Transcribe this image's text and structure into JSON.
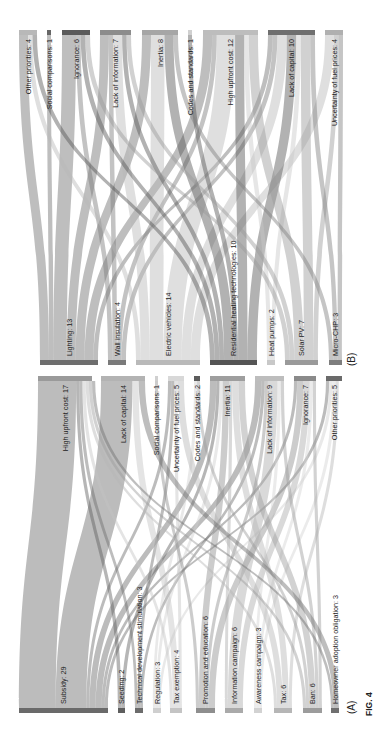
{
  "figure": {
    "caption": "FIG. 4",
    "orientation": "rotated -90deg (labels read bottom-to-top)"
  },
  "chart_data": [
    {
      "type": "sankey",
      "panel_label": "(B)",
      "title": "",
      "source_side": "bottom",
      "sources": [
        {
          "name": "Lighting",
          "value": 13,
          "label": "Lighting: 13",
          "x0": 40,
          "x1": 98,
          "color": "#6e6e6e"
        },
        {
          "name": "Wall insulation",
          "value": 4,
          "label": "Wall insulation: 4",
          "x0": 108,
          "x1": 126,
          "color": "#7a7a7a"
        },
        {
          "name": "Electric vehicles",
          "value": 14,
          "label": "Electric vehicles: 14",
          "x0": 136,
          "x1": 200,
          "color": "#b9b9b9"
        },
        {
          "name": "Residential heating technologies",
          "value": 10,
          "label": "Residential heating technologies: 10",
          "x0": 210,
          "x1": 257,
          "color": "#555555"
        },
        {
          "name": "Heat pumps",
          "value": 2,
          "label": "Heat pumps: 2",
          "x0": 267,
          "x1": 275,
          "color": "#c8c8c8"
        },
        {
          "name": "Solar PV",
          "value": 7,
          "label": "Solar PV: 7",
          "x0": 285,
          "x1": 318,
          "color": "#9a9a9a"
        },
        {
          "name": "Micro-CHP",
          "value": 3,
          "label": "Micro-CHP: 3",
          "x0": 329,
          "x1": 342,
          "color": "#7e7e7e"
        }
      ],
      "targets": [
        {
          "name": "Other priorities",
          "value": 4,
          "label": "Other priorities: 4",
          "x0": 19,
          "x1": 37,
          "color": "#b8b8b8"
        },
        {
          "name": "Social comparisons",
          "value": 1,
          "label": "Social comparisons: 1",
          "x0": 47,
          "x1": 51,
          "color": "#666666"
        },
        {
          "name": "Ignorance",
          "value": 6,
          "label": "Ignorance: 6",
          "x0": 62,
          "x1": 90,
          "color": "#5a5a5a"
        },
        {
          "name": "Lack of information",
          "value": 7,
          "label": "Lack of information: 7",
          "x0": 100,
          "x1": 131,
          "color": "#8c8c8c"
        },
        {
          "name": "Inertia",
          "value": 8,
          "label": "Inertia: 8",
          "x0": 142,
          "x1": 178,
          "color": "#a6a6a6"
        },
        {
          "name": "Codes and standards",
          "value": 1,
          "label": "Codes and standards: 1",
          "x0": 188,
          "x1": 192,
          "color": "#d0d0d0"
        },
        {
          "name": "High upfront cost",
          "value": 12,
          "label": "High upfront cost: 12",
          "x0": 203,
          "x1": 258,
          "color": "#bdbdbd"
        },
        {
          "name": "Lack of capital",
          "value": 10,
          "label": "Lack of capital: 10",
          "x0": 268,
          "x1": 315,
          "color": "#6f6f6f"
        },
        {
          "name": "Uncertainty of fuel prices",
          "value": 4,
          "label": "Uncertainty of fuel prices: 4",
          "x0": 325,
          "x1": 343,
          "color": "#b0b0b0"
        }
      ],
      "links": [
        {
          "source": "Lighting",
          "target": "Other priorities",
          "value": 2
        },
        {
          "source": "Lighting",
          "target": "Social comparisons",
          "value": 1
        },
        {
          "source": "Lighting",
          "target": "Ignorance",
          "value": 3
        },
        {
          "source": "Lighting",
          "target": "Lack of information",
          "value": 2
        },
        {
          "source": "Lighting",
          "target": "Inertia",
          "value": 2
        },
        {
          "source": "Lighting",
          "target": "High upfront cost",
          "value": 2
        },
        {
          "source": "Lighting",
          "target": "Lack of capital",
          "value": 1
        },
        {
          "source": "Wall insulation",
          "target": "Ignorance",
          "value": 1
        },
        {
          "source": "Wall insulation",
          "target": "Lack of information",
          "value": 1
        },
        {
          "source": "Wall insulation",
          "target": "High upfront cost",
          "value": 1
        },
        {
          "source": "Wall insulation",
          "target": "Lack of capital",
          "value": 1
        },
        {
          "source": "Electric vehicles",
          "target": "Other priorities",
          "value": 1
        },
        {
          "source": "Electric vehicles",
          "target": "Lack of information",
          "value": 2
        },
        {
          "source": "Electric vehicles",
          "target": "Inertia",
          "value": 3
        },
        {
          "source": "Electric vehicles",
          "target": "High upfront cost",
          "value": 4
        },
        {
          "source": "Electric vehicles",
          "target": "Lack of capital",
          "value": 2
        },
        {
          "source": "Electric vehicles",
          "target": "Uncertainty of fuel prices",
          "value": 2
        },
        {
          "source": "Residential heating technologies",
          "target": "Other priorities",
          "value": 1
        },
        {
          "source": "Residential heating technologies",
          "target": "Ignorance",
          "value": 1
        },
        {
          "source": "Residential heating technologies",
          "target": "Lack of information",
          "value": 1
        },
        {
          "source": "Residential heating technologies",
          "target": "Inertia",
          "value": 2
        },
        {
          "source": "Residential heating technologies",
          "target": "Codes and standards",
          "value": 1
        },
        {
          "source": "Residential heating technologies",
          "target": "High upfront cost",
          "value": 2
        },
        {
          "source": "Residential heating technologies",
          "target": "Lack of capital",
          "value": 2
        },
        {
          "source": "Heat pumps",
          "target": "High upfront cost",
          "value": 1
        },
        {
          "source": "Heat pumps",
          "target": "Lack of capital",
          "value": 1
        },
        {
          "source": "Solar PV",
          "target": "Ignorance",
          "value": 1
        },
        {
          "source": "Solar PV",
          "target": "Lack of information",
          "value": 1
        },
        {
          "source": "Solar PV",
          "target": "High upfront cost",
          "value": 2
        },
        {
          "source": "Solar PV",
          "target": "Lack of capital",
          "value": 2
        },
        {
          "source": "Solar PV",
          "target": "Uncertainty of fuel prices",
          "value": 1
        },
        {
          "source": "Micro-CHP",
          "target": "Inertia",
          "value": 1
        },
        {
          "source": "Micro-CHP",
          "target": "Lack of capital",
          "value": 1
        },
        {
          "source": "Micro-CHP",
          "target": "Uncertainty of fuel prices",
          "value": 1
        }
      ],
      "geometry": {
        "top_bar_y": 30,
        "bottom_bar_y": 360,
        "bar_thickness": 5
      }
    },
    {
      "type": "sankey",
      "panel_label": "(A)",
      "title": "",
      "source_side": "bottom",
      "sources": [
        {
          "name": "Subsidy",
          "value": 29,
          "label": "Subsidy: 29",
          "x0": 19,
          "x1": 108,
          "color": "#6a6a6a"
        },
        {
          "name": "Seeding",
          "value": 2,
          "label": "Seeding: 2",
          "x0": 118,
          "x1": 125,
          "color": "#5e5e5e"
        },
        {
          "name": "Technical development stimulation",
          "value": 3,
          "label": "Technical development stimulation: 3",
          "x0": 135,
          "x1": 143,
          "color": "#6c6c6c"
        },
        {
          "name": "Regulation",
          "value": 3,
          "label": "Regulation: 3",
          "x0": 153,
          "x1": 161,
          "color": "#cfcfcf"
        },
        {
          "name": "Tax exemption",
          "value": 4,
          "label": "Tax exemption: 4",
          "x0": 170,
          "x1": 182,
          "color": "#c4c4c4"
        },
        {
          "name": "Promotion and education",
          "value": 6,
          "label": "Promotion and education: 6",
          "x0": 196,
          "x1": 215,
          "color": "#8e8e8e"
        },
        {
          "name": "Information campaign",
          "value": 6,
          "label": "Information campaign: 6",
          "x0": 225,
          "x1": 243,
          "color": "#aaaaaa"
        },
        {
          "name": "Awareness campaign",
          "value": 3,
          "label": "Awareness campaign: 3",
          "x0": 254,
          "x1": 262,
          "color": "#d2d2d2"
        },
        {
          "name": "Tax",
          "value": 6,
          "label": "Tax: 6",
          "x0": 274,
          "x1": 292,
          "color": "#b6b6b6"
        },
        {
          "name": "Ban",
          "value": 6,
          "label": "Ban: 6",
          "x0": 303,
          "x1": 322,
          "color": "#9c9c9c"
        },
        {
          "name": "Homeowner adoption obligation",
          "value": 3,
          "label": "Homeowner adoption obligation: 3",
          "x0": 331,
          "x1": 339,
          "color": "#6f6f6f"
        }
      ],
      "targets": [
        {
          "name": "High upfront cost",
          "value": 17,
          "label": "High upfront cost: 17",
          "x0": 38,
          "x1": 92,
          "color": "#9a9a9a"
        },
        {
          "name": "Lack of capital",
          "value": 14,
          "label": "Lack of capital: 14",
          "x0": 101,
          "x1": 145,
          "color": "#b3b3b3"
        },
        {
          "name": "Social comparisons",
          "value": 1,
          "label": "Social comparisons: 1",
          "x0": 155,
          "x1": 158,
          "color": "#d0d0d0"
        },
        {
          "name": "Uncertainty of fuel prices",
          "value": 5,
          "label": "Uncertainty of fuel prices: 5",
          "x0": 168,
          "x1": 184,
          "color": "#d8d8d8"
        },
        {
          "name": "Codes and standards",
          "value": 2,
          "label": "Codes and standards: 2",
          "x0": 194,
          "x1": 200,
          "color": "#5c5c5c"
        },
        {
          "name": "Inertia",
          "value": 11,
          "label": "Inertia: 11",
          "x0": 210,
          "x1": 245,
          "color": "#9e9e9e"
        },
        {
          "name": "Lack of information",
          "value": 9,
          "label": "Lack of information: 9",
          "x0": 255,
          "x1": 284,
          "color": "#bdbdbd"
        },
        {
          "name": "Ignorance",
          "value": 7,
          "label": "Ignorance: 7",
          "x0": 294,
          "x1": 316,
          "color": "#8a8a8a"
        },
        {
          "name": "Other priorities",
          "value": 5,
          "label": "Other priorities: 5",
          "x0": 326,
          "x1": 342,
          "color": "#6a6a6a"
        }
      ],
      "links": [
        {
          "source": "Subsidy",
          "target": "High upfront cost",
          "value": 12
        },
        {
          "source": "Subsidy",
          "target": "Lack of capital",
          "value": 10
        },
        {
          "source": "Subsidy",
          "target": "Uncertainty of fuel prices",
          "value": 1
        },
        {
          "source": "Subsidy",
          "target": "Inertia",
          "value": 2
        },
        {
          "source": "Subsidy",
          "target": "Lack of information",
          "value": 2
        },
        {
          "source": "Subsidy",
          "target": "Ignorance",
          "value": 1
        },
        {
          "source": "Subsidy",
          "target": "Other priorities",
          "value": 1
        },
        {
          "source": "Seeding",
          "target": "High upfront cost",
          "value": 1
        },
        {
          "source": "Seeding",
          "target": "Inertia",
          "value": 1
        },
        {
          "source": "Technical development stimulation",
          "target": "High upfront cost",
          "value": 1
        },
        {
          "source": "Technical development stimulation",
          "target": "Uncertainty of fuel prices",
          "value": 1
        },
        {
          "source": "Technical development stimulation",
          "target": "Lack of information",
          "value": 1
        },
        {
          "source": "Regulation",
          "target": "Codes and standards",
          "value": 1
        },
        {
          "source": "Regulation",
          "target": "Inertia",
          "value": 1
        },
        {
          "source": "Regulation",
          "target": "Other priorities",
          "value": 1
        },
        {
          "source": "Tax exemption",
          "target": "High upfront cost",
          "value": 1
        },
        {
          "source": "Tax exemption",
          "target": "Lack of capital",
          "value": 2
        },
        {
          "source": "Tax exemption",
          "target": "Uncertainty of fuel prices",
          "value": 1
        },
        {
          "source": "Promotion and education",
          "target": "Social comparisons",
          "value": 1
        },
        {
          "source": "Promotion and education",
          "target": "Inertia",
          "value": 2
        },
        {
          "source": "Promotion and education",
          "target": "Lack of information",
          "value": 1
        },
        {
          "source": "Promotion and education",
          "target": "Ignorance",
          "value": 2
        },
        {
          "source": "Information campaign",
          "target": "Inertia",
          "value": 1
        },
        {
          "source": "Information campaign",
          "target": "Lack of information",
          "value": 3
        },
        {
          "source": "Information campaign",
          "target": "Ignorance",
          "value": 2
        },
        {
          "source": "Awareness campaign",
          "target": "Lack of information",
          "value": 1
        },
        {
          "source": "Awareness campaign",
          "target": "Ignorance",
          "value": 1
        },
        {
          "source": "Awareness campaign",
          "target": "Other priorities",
          "value": 1
        },
        {
          "source": "Tax",
          "target": "High upfront cost",
          "value": 1
        },
        {
          "source": "Tax",
          "target": "Uncertainty of fuel prices",
          "value": 2
        },
        {
          "source": "Tax",
          "target": "Inertia",
          "value": 2
        },
        {
          "source": "Tax",
          "target": "Other priorities",
          "value": 1
        },
        {
          "source": "Ban",
          "target": "High upfront cost",
          "value": 1
        },
        {
          "source": "Ban",
          "target": "Codes and standards",
          "value": 1
        },
        {
          "source": "Ban",
          "target": "Inertia",
          "value": 2
        },
        {
          "source": "Ban",
          "target": "Lack of information",
          "value": 1
        },
        {
          "source": "Ban",
          "target": "Ignorance",
          "value": 1
        },
        {
          "source": "Homeowner adoption obligation",
          "target": "High upfront cost",
          "value": 1
        },
        {
          "source": "Homeowner adoption obligation",
          "target": "Lack of capital",
          "value": 2
        }
      ],
      "geometry": {
        "top_bar_y": 376,
        "bottom_bar_y": 708,
        "bar_thickness": 5
      }
    }
  ]
}
